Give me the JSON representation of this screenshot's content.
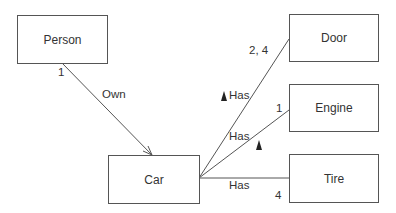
{
  "diagram": {
    "type": "uml-class-association",
    "classes": [
      {
        "id": "person",
        "name": "Person"
      },
      {
        "id": "car",
        "name": "Car"
      },
      {
        "id": "door",
        "name": "Door"
      },
      {
        "id": "engine",
        "name": "Engine"
      },
      {
        "id": "tire",
        "name": "Tire"
      }
    ],
    "associations": [
      {
        "from": "person",
        "to": "car",
        "name": "Own",
        "multiplicity_from": "1",
        "navigable_to": "car"
      },
      {
        "from": "car",
        "to": "door",
        "name": "Has",
        "multiplicity_to": "2, 4",
        "direction_marker": "▲"
      },
      {
        "from": "car",
        "to": "engine",
        "name": "Has",
        "multiplicity_to": "1",
        "direction_marker": "▲"
      },
      {
        "from": "car",
        "to": "tire",
        "name": "Has",
        "multiplicity_to": "4"
      }
    ]
  },
  "colors": {
    "line": "#555555",
    "text": "#333333",
    "marker": "#222222"
  }
}
